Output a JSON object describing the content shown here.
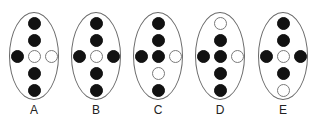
{
  "diagram": {
    "colors": {
      "filled": "#121212",
      "empty_stroke": "#7a7a7a",
      "oval_stroke": "#6a6a6a",
      "background": "#ffffff"
    },
    "layout_note": "Each figure: column rows top,2,middle,4,bottom; middle row is [left, center, right]",
    "figures": [
      {
        "label": "A",
        "column": [
          "filled",
          "filled",
          "empty",
          "filled",
          "filled"
        ],
        "middle_row": [
          "filled",
          "empty",
          "empty"
        ]
      },
      {
        "label": "B",
        "column": [
          "filled",
          "filled",
          "empty",
          "filled",
          "filled"
        ],
        "middle_row": [
          "filled",
          "empty",
          "filled"
        ]
      },
      {
        "label": "C",
        "column": [
          "filled",
          "filled",
          "filled",
          "empty",
          "filled"
        ],
        "middle_row": [
          "filled",
          "filled",
          "empty"
        ]
      },
      {
        "label": "D",
        "column": [
          "empty",
          "filled",
          "filled",
          "filled",
          "filled"
        ],
        "middle_row": [
          "filled",
          "filled",
          "empty"
        ]
      },
      {
        "label": "E",
        "column": [
          "filled",
          "filled",
          "empty",
          "filled",
          "empty"
        ],
        "middle_row": [
          "filled",
          "empty",
          "filled"
        ]
      }
    ]
  }
}
